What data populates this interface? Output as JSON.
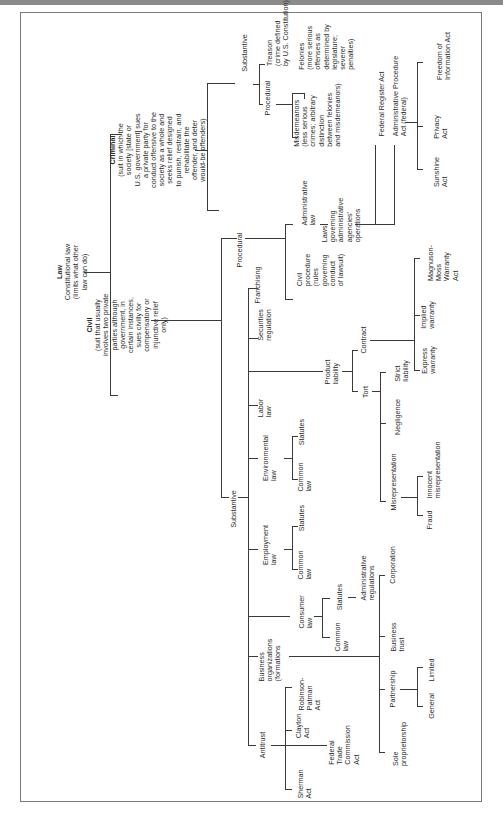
{
  "diagram": {
    "root": {
      "title": "Law",
      "subtitle": "Constitutional law\n(limits what other\nlaw can do)"
    },
    "civil": {
      "title": "Civil",
      "desc": "(suit that usually\ninvolves two private\nparties although\ngovernment, in\ncertain instances,\nsues civilly for\ncompensatory or\ninjunctive relief\nonly)"
    },
    "criminal": {
      "title": "Criminal",
      "desc": "(suit in which the\nsociety [state or\nU.S. government] sues\na private party for\nconduct offensive to the\nsociety as a whole and\nseeks relief designed\nto punish, restrain, and\nrehabilitate the\noffender, and deter\nwould-be offenders)"
    },
    "criminal_branches": {
      "procedural": "Procedural",
      "substantive": "Substantive",
      "treason": "Treason\n(crime defined\nby U.S. Constitution)",
      "felonies": "Felonies\n(more serious\noffenses as\ndetermined by\nlegislature;\nseverer\npenalties)",
      "misdemeanors": "Misdemeanors\n(less serious\ncrimes; arbitrary\ndistinction\nbetween felonies\nand misdemeanors)"
    },
    "civil_branches": {
      "procedural": "Procedural",
      "substantive": "Substantive",
      "civil_procedure": "Civil\nprocedure\n(rules\ngoverning\nconduct\nof lawsuit)",
      "administrative_law": "Administrative\nlaw",
      "agencies": "Laws\ngoverning\nadministrative\nagencies'\noperations",
      "federal_register": "Federal Register Act",
      "apa": "Administrative Procedure\nAct (federal)",
      "sunshine": "Sunshine\nAct",
      "privacy": "Privacy\nAct",
      "foia": "Freedom of\nInformation Act"
    },
    "substantive_areas": {
      "franchising": "Franchising",
      "securities": "Securities\nregulation",
      "product_liability": "Product\nliability",
      "contract": "Contract",
      "tort": "Tort",
      "magnuson": "Magnuson-\nMoss\nWarranty\nAct",
      "implied": "Implied\nwarranty",
      "express": "Express\nwarranty",
      "strict": "Strict\nliability",
      "negligence": "Negligence",
      "misrep": "Misrepresentation",
      "innocent": "Innocent\nmisrepresentation",
      "fraud": "Fraud",
      "labor": "Labor\nlaw",
      "environmental": "Environmental\nlaw",
      "env_statutes": "Statutes",
      "env_common": "Common\nlaw",
      "employment": "Employment\nlaw",
      "emp_statutes": "Statutes",
      "emp_common": "Common\nlaw",
      "consumer": "Consumer\nlaw",
      "con_statutes": "Statutes",
      "con_common": "Common\nlaw",
      "admin_regs": "Administrative\nregulations",
      "business_org": "Business\norganizations\n(formations",
      "corporation": "Corporation",
      "business_trust": "Business\ntrust",
      "partnership": "Partnership",
      "limited": "Limited",
      "general": "General",
      "sole": "Sole\nproprietorship",
      "antitrust": "Antitrust",
      "robinson": "Robinson-\nPatman\nAct",
      "clayton": "Clayton\nAct",
      "ftc": "Federal\nTrade\nCommission\nAct",
      "sherman": "Sherman\nAct"
    }
  }
}
